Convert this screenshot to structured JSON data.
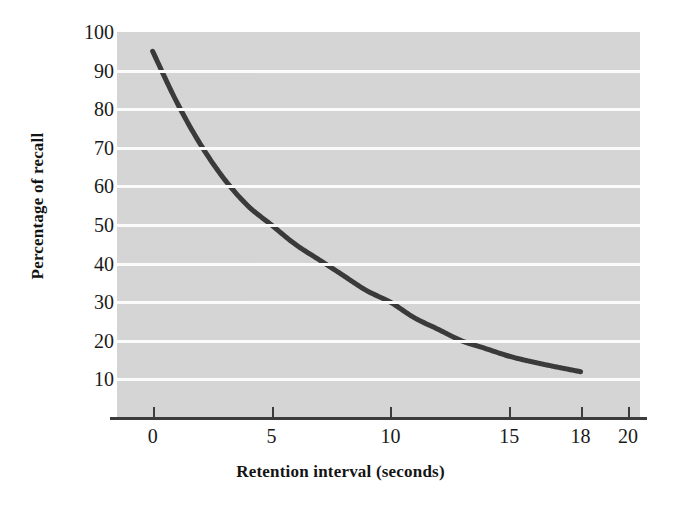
{
  "chart_data": {
    "type": "line",
    "title": "",
    "xlabel": "Retention interval (seconds)",
    "ylabel": "Percentage of recall",
    "xlim": [
      -1.5,
      20.5
    ],
    "ylim": [
      0,
      100
    ],
    "xticks": [
      0,
      5,
      10,
      15,
      18,
      20
    ],
    "xtick_labels": [
      "0",
      "5",
      "10",
      "15",
      "18",
      "20"
    ],
    "yticks": [
      10,
      20,
      30,
      40,
      50,
      60,
      70,
      80,
      90,
      100
    ],
    "ytick_labels": [
      "10",
      "20",
      "30",
      "40",
      "50",
      "60",
      "70",
      "80",
      "90",
      "100"
    ],
    "grid": "horizontal-white-gridlines",
    "legend": "none",
    "series": [
      {
        "name": "Percentage of recall",
        "x": [
          0,
          1,
          2,
          3,
          4,
          5,
          6,
          7,
          8,
          9,
          10,
          11,
          12,
          13,
          14,
          15,
          16,
          17,
          18
        ],
        "values": [
          95,
          82,
          71,
          62,
          55,
          50,
          45,
          41,
          37,
          33,
          30,
          26,
          23,
          20,
          18,
          16,
          14.5,
          13.2,
          12
        ]
      }
    ],
    "key_points": [
      {
        "x": 0,
        "y": 95
      },
      {
        "x": 5,
        "y": 50
      },
      {
        "x": 10,
        "y": 30
      },
      {
        "x": 15,
        "y": 16
      },
      {
        "x": 18,
        "y": 12
      }
    ],
    "colors": {
      "curve": "#3a3a3a",
      "panel_background": "#d8d8d8",
      "gridline": "#fbfbfb",
      "axis": "#3c3c3c",
      "text": "#1a1a1a"
    }
  },
  "axes": {
    "y_title": "Percentage of recall",
    "x_title": "Retention interval (seconds)",
    "y_tick_labels": [
      "100",
      "90",
      "80",
      "70",
      "60",
      "50",
      "40",
      "30",
      "20",
      "10"
    ],
    "x_tick_labels": [
      "0",
      "5",
      "10",
      "15",
      "18",
      "20"
    ]
  }
}
